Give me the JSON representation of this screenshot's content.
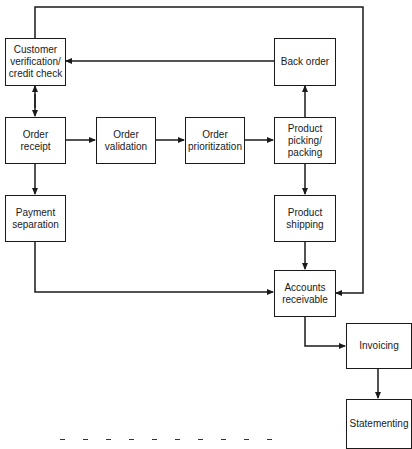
{
  "diagram": {
    "type": "flowchart",
    "nodes": {
      "customer_verification": {
        "label": "Customer\nverification/\ncredit check"
      },
      "back_order": {
        "label": "Back order"
      },
      "order_receipt": {
        "label": "Order\nreceipt"
      },
      "order_validation": {
        "label": "Order\nvalidation"
      },
      "order_prioritization": {
        "label": "Order\nprioritization"
      },
      "product_picking": {
        "label": "Product\npicking/\npacking"
      },
      "payment_separation": {
        "label": "Payment\nseparation"
      },
      "product_shipping": {
        "label": "Product\nshipping"
      },
      "accounts_receivable": {
        "label": "Accounts\nreceivable"
      },
      "invoicing": {
        "label": "Invoicing"
      },
      "statementing": {
        "label": "Statementing"
      }
    },
    "edges": [
      {
        "from": "customer_verification",
        "to": "order_receipt",
        "bidirectional": true
      },
      {
        "from": "back_order",
        "to": "customer_verification"
      },
      {
        "from": "order_receipt",
        "to": "order_validation"
      },
      {
        "from": "order_validation",
        "to": "order_prioritization"
      },
      {
        "from": "order_prioritization",
        "to": "product_picking"
      },
      {
        "from": "product_picking",
        "to": "back_order"
      },
      {
        "from": "product_picking",
        "to": "product_shipping"
      },
      {
        "from": "order_receipt",
        "to": "payment_separation"
      },
      {
        "from": "product_shipping",
        "to": "accounts_receivable"
      },
      {
        "from": "payment_separation",
        "to": "accounts_receivable"
      },
      {
        "from": "customer_verification",
        "to": "accounts_receivable",
        "route": "top-loop-right"
      },
      {
        "from": "accounts_receivable",
        "to": "invoicing"
      },
      {
        "from": "invoicing",
        "to": "statementing"
      }
    ],
    "caption": {
      "visible": "partially clipped at bottom edge"
    }
  },
  "colors": {
    "line": "#1a1a1a",
    "background": "#ffffff"
  }
}
